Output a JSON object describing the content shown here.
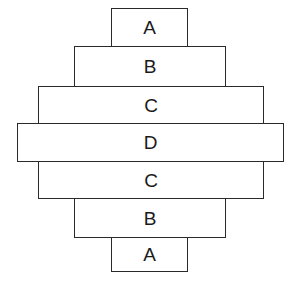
{
  "diagram": {
    "type": "stacked-tier-diamond",
    "stroke_color": "#2a2a2a",
    "fill_color": "#ffffff",
    "tiers": [
      {
        "label": "A",
        "left": 111,
        "top": 8,
        "width": 77,
        "height": 39
      },
      {
        "label": "B",
        "left": 74,
        "top": 46,
        "width": 152,
        "height": 41
      },
      {
        "label": "C",
        "left": 38,
        "top": 86,
        "width": 226,
        "height": 38
      },
      {
        "label": "D",
        "left": 17,
        "top": 123,
        "width": 267,
        "height": 39
      },
      {
        "label": "C",
        "left": 38,
        "top": 161,
        "width": 226,
        "height": 38
      },
      {
        "label": "B",
        "left": 74,
        "top": 198,
        "width": 152,
        "height": 40
      },
      {
        "label": "A",
        "left": 111,
        "top": 237,
        "width": 77,
        "height": 35
      }
    ]
  }
}
